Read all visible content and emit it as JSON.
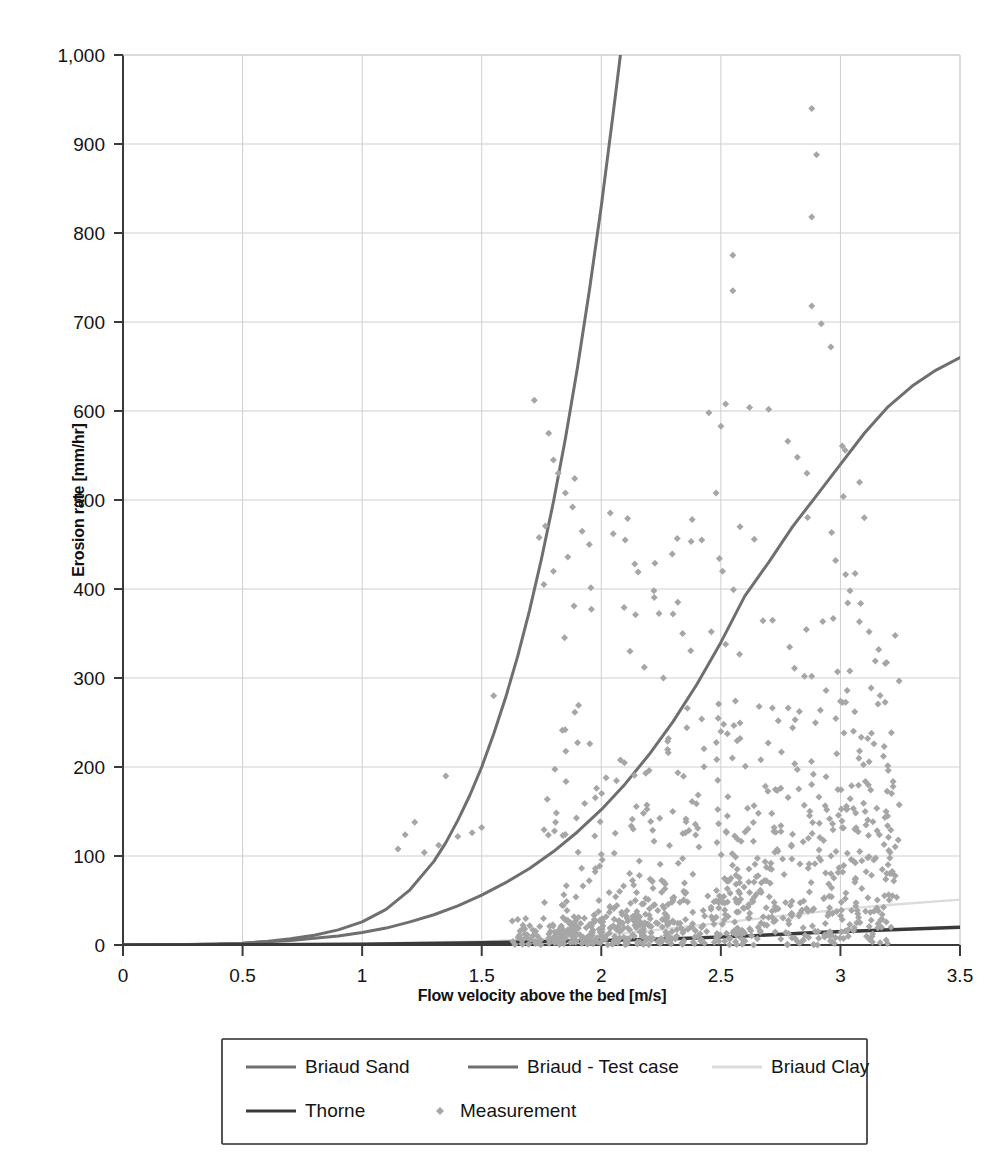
{
  "chart_data": {
    "type": "scatter",
    "title": "",
    "xlabel": "Flow velocity above the bed [m/s]",
    "ylabel": "Erosion rate [mm/hr]",
    "xlim": [
      0,
      3.5
    ],
    "ylim": [
      0,
      1000
    ],
    "xticks": [
      "0",
      "0.5",
      "1",
      "1.5",
      "2",
      "2.5",
      "3",
      "3.5"
    ],
    "xtick_values": [
      0,
      0.5,
      1,
      1.5,
      2,
      2.5,
      3,
      3.5
    ],
    "yticks": [
      "0",
      "100",
      "200",
      "300",
      "400",
      "500",
      "600",
      "700",
      "800",
      "900",
      "1,000"
    ],
    "ytick_values": [
      0,
      100,
      200,
      300,
      400,
      500,
      600,
      700,
      800,
      900,
      1000
    ],
    "grid": true,
    "grid_color": "#cfcfcf",
    "axis_color": "#3a3a3a",
    "legend_position": "below-bottom-center",
    "series": [
      {
        "name": "Briaud Sand",
        "type": "line",
        "color": "#6f6f6f",
        "width": 3.0,
        "points": [
          [
            0,
            0
          ],
          [
            0.2,
            0.2
          ],
          [
            0.4,
            1
          ],
          [
            0.5,
            2
          ],
          [
            0.6,
            4
          ],
          [
            0.7,
            7
          ],
          [
            0.8,
            11
          ],
          [
            0.9,
            17
          ],
          [
            1.0,
            26
          ],
          [
            1.1,
            40
          ],
          [
            1.2,
            62
          ],
          [
            1.3,
            94
          ],
          [
            1.35,
            115
          ],
          [
            1.4,
            140
          ],
          [
            1.45,
            168
          ],
          [
            1.5,
            200
          ],
          [
            1.55,
            237
          ],
          [
            1.6,
            278
          ],
          [
            1.65,
            324
          ],
          [
            1.7,
            376
          ],
          [
            1.75,
            434
          ],
          [
            1.8,
            498
          ],
          [
            1.85,
            569
          ],
          [
            1.9,
            648
          ],
          [
            1.95,
            735
          ],
          [
            2.0,
            830
          ],
          [
            2.05,
            935
          ],
          [
            2.08,
            1000
          ]
        ]
      },
      {
        "name": "Briaud - Test case",
        "type": "line",
        "color": "#6f6f6f",
        "width": 3.0,
        "points": [
          [
            0,
            0
          ],
          [
            0.3,
            0.5
          ],
          [
            0.5,
            2
          ],
          [
            0.7,
            5
          ],
          [
            0.9,
            10
          ],
          [
            1.0,
            14
          ],
          [
            1.1,
            19
          ],
          [
            1.2,
            26
          ],
          [
            1.3,
            34
          ],
          [
            1.4,
            44
          ],
          [
            1.5,
            56
          ],
          [
            1.6,
            70
          ],
          [
            1.7,
            86
          ],
          [
            1.8,
            105
          ],
          [
            1.9,
            127
          ],
          [
            2.0,
            152
          ],
          [
            2.1,
            181
          ],
          [
            2.2,
            214
          ],
          [
            2.3,
            251
          ],
          [
            2.4,
            293
          ],
          [
            2.5,
            340
          ],
          [
            2.6,
            392
          ],
          [
            2.7,
            430
          ],
          [
            2.8,
            470
          ],
          [
            2.9,
            505
          ],
          [
            3.0,
            540
          ],
          [
            3.1,
            575
          ],
          [
            3.2,
            605
          ],
          [
            3.3,
            628
          ],
          [
            3.4,
            646
          ],
          [
            3.5,
            660
          ]
        ]
      },
      {
        "name": "Briaud Clay",
        "type": "line",
        "color": "#dcdcdc",
        "width": 2.4,
        "points": [
          [
            0,
            0
          ],
          [
            0.5,
            0.4
          ],
          [
            1.0,
            1.5
          ],
          [
            1.5,
            4
          ],
          [
            1.8,
            7
          ],
          [
            2.0,
            11
          ],
          [
            2.2,
            16
          ],
          [
            2.4,
            22
          ],
          [
            2.6,
            28
          ],
          [
            2.8,
            34
          ],
          [
            3.0,
            40
          ],
          [
            3.2,
            45
          ],
          [
            3.5,
            51
          ]
        ]
      },
      {
        "name": "Thorne",
        "type": "line",
        "color": "#3a3a3a",
        "width": 3.4,
        "points": [
          [
            0,
            0
          ],
          [
            0.5,
            0.3
          ],
          [
            1.0,
            1
          ],
          [
            1.5,
            2.5
          ],
          [
            2.0,
            5
          ],
          [
            2.3,
            7
          ],
          [
            2.6,
            10
          ],
          [
            2.9,
            14
          ],
          [
            3.1,
            16
          ],
          [
            3.3,
            18
          ],
          [
            3.5,
            20
          ]
        ]
      },
      {
        "name": "Measurement",
        "type": "scatter",
        "color": "#a6a6a6",
        "marker": "diamond",
        "marker_size": 7,
        "n_points": 900,
        "x_range": [
          1.1,
          3.25
        ],
        "y_range": [
          0,
          940
        ],
        "density_note": "Dense cloud concentrated 1.8-3.2 m/s below 250 mm/hr; sparse high outliers to 940 mm/hr near 2.9 m/s"
      }
    ]
  },
  "legend": {
    "entries": [
      {
        "label": "Briaud Sand",
        "marker": "line",
        "color": "#6f6f6f"
      },
      {
        "label": "Briaud - Test case",
        "marker": "line",
        "color": "#6f6f6f"
      },
      {
        "label": "Briaud Clay",
        "marker": "line",
        "color": "#dcdcdc"
      },
      {
        "label": "Thorne",
        "marker": "line",
        "color": "#3a3a3a"
      },
      {
        "label": "Measurement",
        "marker": "diamond",
        "color": "#a6a6a6"
      }
    ]
  }
}
